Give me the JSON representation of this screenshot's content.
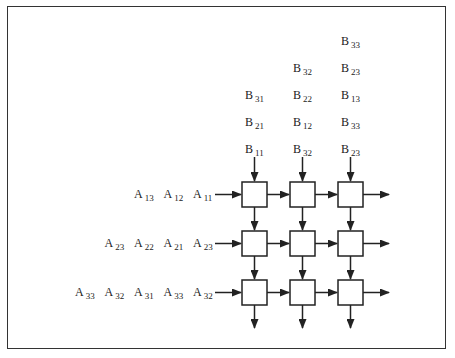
{
  "diagram": {
    "b_inputs": [
      {
        "col": 0,
        "labels": [
          {
            "name": "B",
            "sub": "31"
          },
          {
            "name": "B",
            "sub": "21"
          },
          {
            "name": "B",
            "sub": "11"
          }
        ]
      },
      {
        "col": 1,
        "labels": [
          {
            "name": "B",
            "sub": "32"
          },
          {
            "name": "B",
            "sub": "22"
          },
          {
            "name": "B",
            "sub": "12"
          },
          {
            "name": "B",
            "sub": "32"
          }
        ]
      },
      {
        "col": 2,
        "labels": [
          {
            "name": "B",
            "sub": "33"
          },
          {
            "name": "B",
            "sub": "23"
          },
          {
            "name": "B",
            "sub": "13"
          },
          {
            "name": "B",
            "sub": "33"
          },
          {
            "name": "B",
            "sub": "23"
          }
        ]
      }
    ],
    "a_inputs": [
      {
        "row": 0,
        "labels": [
          {
            "name": "A",
            "sub": "13"
          },
          {
            "name": "A",
            "sub": "12"
          },
          {
            "name": "A",
            "sub": "11"
          }
        ]
      },
      {
        "row": 1,
        "labels": [
          {
            "name": "A",
            "sub": "23"
          },
          {
            "name": "A",
            "sub": "22"
          },
          {
            "name": "A",
            "sub": "21"
          },
          {
            "name": "A",
            "sub": "23"
          }
        ]
      },
      {
        "row": 2,
        "labels": [
          {
            "name": "A",
            "sub": "33"
          },
          {
            "name": "A",
            "sub": "32"
          },
          {
            "name": "A",
            "sub": "31"
          },
          {
            "name": "A",
            "sub": "33"
          },
          {
            "name": "A",
            "sub": "32"
          }
        ]
      }
    ],
    "grid": {
      "rows": 3,
      "cols": 3
    },
    "colors": {
      "stroke": "#222222",
      "background": "#ffffff",
      "border": "#333333"
    }
  }
}
